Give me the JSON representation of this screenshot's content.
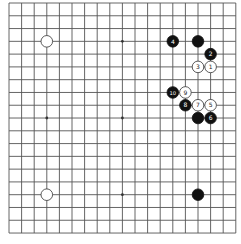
{
  "board": {
    "size": 19,
    "origin_x": 9,
    "origin_y": 3,
    "spacing_x": 12.6,
    "spacing_y": 12.78,
    "line_color": "#555555",
    "background": "#ffffff",
    "hoshi": [
      [
        3,
        3
      ],
      [
        9,
        3
      ],
      [
        15,
        3
      ],
      [
        3,
        9
      ],
      [
        9,
        9
      ],
      [
        15,
        9
      ],
      [
        3,
        15
      ],
      [
        9,
        15
      ],
      [
        15,
        15
      ]
    ]
  },
  "stones": [
    {
      "color": "white",
      "col": 3,
      "row": 3,
      "label": ""
    },
    {
      "color": "white",
      "col": 3,
      "row": 15,
      "label": ""
    },
    {
      "color": "black",
      "col": 15,
      "row": 15,
      "label": ""
    },
    {
      "color": "black",
      "col": 15,
      "row": 3,
      "label": ""
    },
    {
      "color": "black",
      "col": 15,
      "row": 9,
      "label": ""
    },
    {
      "color": "white",
      "col": 16,
      "row": 5,
      "label": "1"
    },
    {
      "color": "black",
      "col": 16,
      "row": 4,
      "label": "2"
    },
    {
      "color": "white",
      "col": 15,
      "row": 5,
      "label": "3"
    },
    {
      "color": "black",
      "col": 13,
      "row": 3,
      "label": "4"
    },
    {
      "color": "white",
      "col": 16,
      "row": 8,
      "label": "5"
    },
    {
      "color": "black",
      "col": 16,
      "row": 9,
      "label": "6"
    },
    {
      "color": "white",
      "col": 15,
      "row": 8,
      "label": "7"
    },
    {
      "color": "black",
      "col": 14,
      "row": 8,
      "label": "8"
    },
    {
      "color": "white",
      "col": 14,
      "row": 7,
      "label": "9"
    },
    {
      "color": "black",
      "col": 13,
      "row": 7,
      "label": "10"
    }
  ],
  "colors": {
    "black_stone": "#111111",
    "white_stone": "#ffffff",
    "stone_outline": "#333333",
    "black_label": "#ffffff",
    "white_label": "#222222"
  }
}
